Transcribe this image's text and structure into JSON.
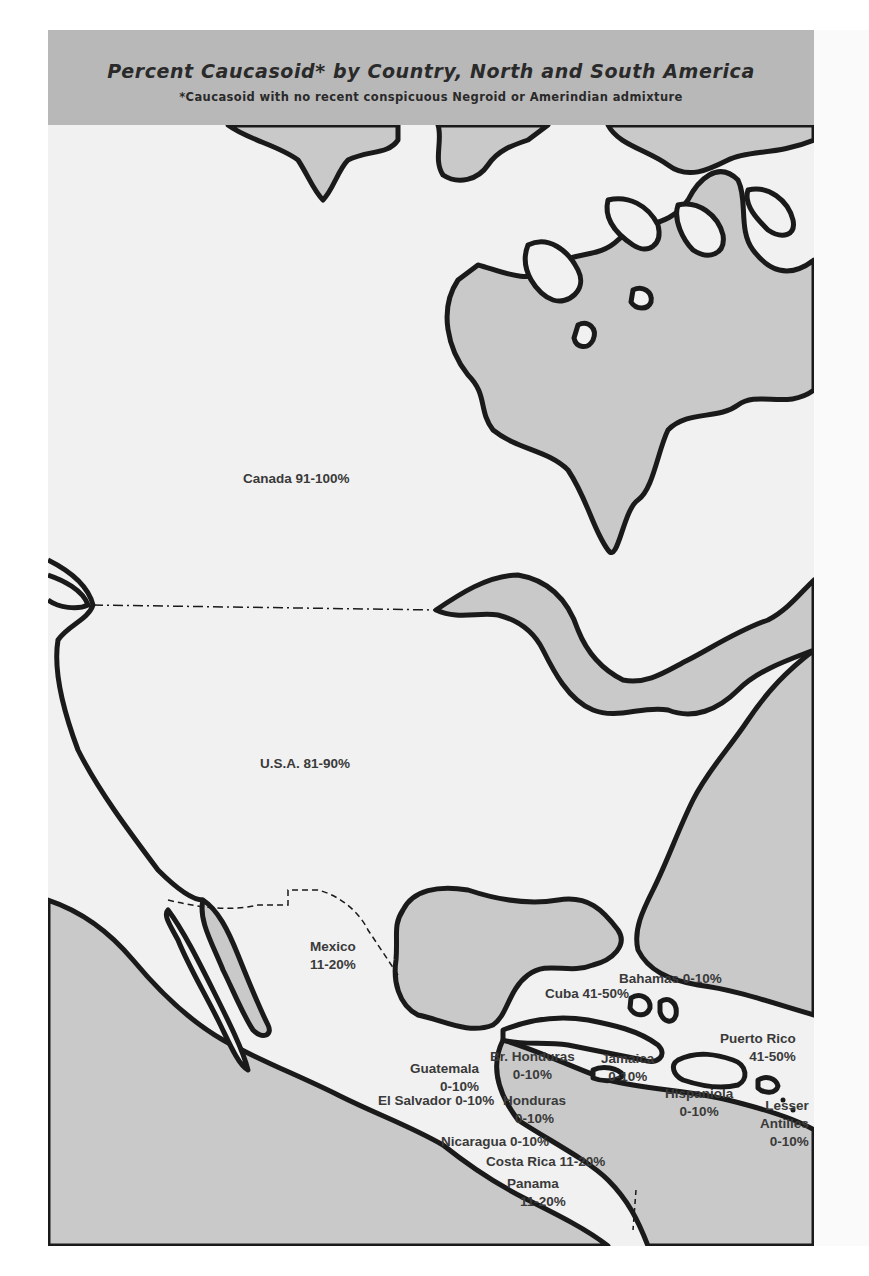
{
  "map": {
    "title": "Percent Caucasoid* by Country, North and South America",
    "footnote": "*Caucasoid with no recent conspicuous Negroid or Amerindian admixture",
    "colors": {
      "header_bg": "#b8b8b8",
      "land": "#f1f1f1",
      "water": "#c9c9c9",
      "coastline": "#1a1a1a",
      "text": "#3a3a3a"
    },
    "regions": [
      {
        "id": "canada",
        "name": "Canada",
        "value": "91-100%"
      },
      {
        "id": "usa",
        "name": "U.S.A.",
        "value": "81-90%"
      },
      {
        "id": "mexico",
        "name": "Mexico",
        "value": "11-20%"
      },
      {
        "id": "bahamas",
        "name": "Bahamas",
        "value": "0-10%"
      },
      {
        "id": "cuba",
        "name": "Cuba",
        "value": "41-50%"
      },
      {
        "id": "puerto-rico",
        "name": "Puerto Rico",
        "value": "41-50%"
      },
      {
        "id": "guatemala",
        "name": "Guatemala",
        "value": "0-10%"
      },
      {
        "id": "br-honduras",
        "name": "Br. Honduras",
        "value": "0-10%"
      },
      {
        "id": "jamaica",
        "name": "Jamaica",
        "value": "0-10%"
      },
      {
        "id": "hispaniola",
        "name": "Hispaniola",
        "value": "0-10%"
      },
      {
        "id": "lesser-antilles",
        "name": "Lesser Antilles",
        "value": "0-10%"
      },
      {
        "id": "el-salvador",
        "name": "El Salvador",
        "value": "0-10%"
      },
      {
        "id": "honduras",
        "name": "Honduras",
        "value": "0-10%"
      },
      {
        "id": "nicaragua",
        "name": "Nicaragua",
        "value": "0-10%"
      },
      {
        "id": "costa-rica",
        "name": "Costa Rica",
        "value": "11-20%"
      },
      {
        "id": "panama",
        "name": "Panama",
        "value": "11-20%"
      }
    ],
    "labels": {
      "canada": "Canada 91-100%",
      "usa": "U.S.A. 81-90%",
      "mexico_name": "Mexico",
      "mexico_value": "11-20%",
      "bahamas": "Bahamas 0-10%",
      "cuba": "Cuba 41-50%",
      "puerto_rico_name": "Puerto Rico",
      "puerto_rico_value": "41-50%",
      "guatemala_name": "Guatemala",
      "guatemala_value": "0-10%",
      "br_honduras_name": "Br. Honduras",
      "br_honduras_value": "0-10%",
      "jamaica_name": "Jamaica",
      "jamaica_value": "0-10%",
      "hispaniola_name": "Hispaniola",
      "hispaniola_value": "0-10%",
      "lesser_antilles_name1": "Lesser",
      "lesser_antilles_name2": "Antilles",
      "lesser_antilles_value": "0-10%",
      "el_salvador": "El Salvador 0-10%",
      "honduras_name": "Honduras",
      "honduras_value": "0-10%",
      "nicaragua": "Nicaragua 0-10%",
      "costa_rica": "Costa Rica 11-20%",
      "panama_name": "Panama",
      "panama_value": "11-20%"
    }
  }
}
